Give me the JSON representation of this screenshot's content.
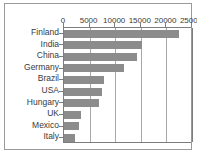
{
  "chart_data": {
    "type": "bar",
    "orientation": "horizontal",
    "title": "",
    "xlabel": "",
    "ylabel": "",
    "categories": [
      "Finland",
      "India",
      "China",
      "Germany",
      "Brazil",
      "USA",
      "Hungary",
      "UK",
      "Mexico",
      "Italy"
    ],
    "values": [
      22500,
      15200,
      14200,
      11700,
      7900,
      7400,
      6900,
      3400,
      3000,
      2200
    ],
    "xlim": [
      0,
      25000
    ],
    "xticks": [
      0,
      5000,
      10000,
      15000,
      20000,
      25000
    ],
    "xtick_labels": [
      "0",
      "5000",
      "10000",
      "15000",
      "20000",
      "25000"
    ],
    "grid": true,
    "legend": false,
    "bar_color": "#8c8c8c",
    "axis_color": "#7d7d7d",
    "grid_color": "#a8a8a8",
    "text_color": "#3a3a3a",
    "background": "#ffffff"
  }
}
